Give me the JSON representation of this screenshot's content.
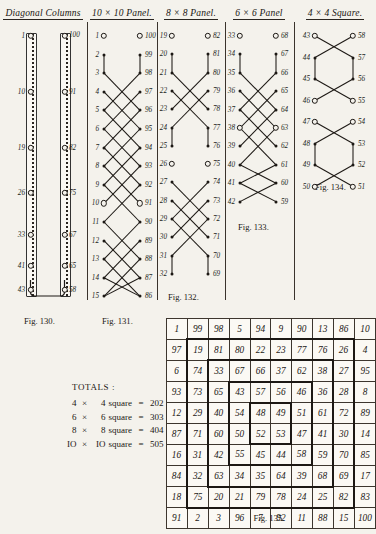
{
  "page": {
    "headings": [
      {
        "id": "diagonal-columns",
        "label": "Diagonal Columns"
      },
      {
        "id": "panel-10x10",
        "label": "10 × 10 Panel."
      },
      {
        "id": "panel-8x8",
        "label": "8 × 8 Panel."
      },
      {
        "id": "panel-6x6",
        "label": "6 × 6 Panel"
      },
      {
        "id": "square-4x4",
        "label": "4 × 4 Square."
      }
    ],
    "captions": {
      "fig130": "Fig. 130.",
      "fig131": "Fig. 131.",
      "fig132": "Fig. 132.",
      "fig133": "Fig. 133.",
      "fig134": "Fig. 134.",
      "fig135": "Fig. 135."
    }
  },
  "diagonal_columns": {
    "left_labels": [
      "1",
      "10",
      "19",
      "26",
      "33",
      "41",
      "43"
    ],
    "right_labels": [
      "100",
      "91",
      "82",
      "75",
      "67",
      "65",
      "58"
    ]
  },
  "panel_10x10": {
    "left_labels": [
      "1",
      "2",
      "3",
      "4",
      "5",
      "6",
      "7",
      "8",
      "9",
      "10",
      "11",
      "12",
      "13",
      "14",
      "15"
    ],
    "right_labels": [
      "100",
      "99",
      "98",
      "97",
      "96",
      "95",
      "94",
      "93",
      "92",
      "91",
      "90",
      "89",
      "88",
      "87",
      "86"
    ]
  },
  "panel_8x8": {
    "left_labels": [
      "19",
      "20",
      "21",
      "22",
      "23",
      "24",
      "25",
      "26",
      "27",
      "28",
      "29",
      "30",
      "31",
      "32"
    ],
    "right_labels": [
      "82",
      "81",
      "80",
      "79",
      "78",
      "77",
      "76",
      "75",
      "74",
      "73",
      "72",
      "71",
      "70",
      "69"
    ]
  },
  "panel_6x6": {
    "left_labels": [
      "33",
      "34",
      "35",
      "36",
      "37",
      "38",
      "39",
      "40",
      "41",
      "42"
    ],
    "right_labels": [
      "68",
      "67",
      "66",
      "65",
      "64",
      "63",
      "62",
      "61",
      "60",
      "59"
    ]
  },
  "square_4x4": {
    "left_labels": [
      "43",
      "44",
      "45",
      "46",
      "47",
      "48",
      "49",
      "50"
    ],
    "right_labels": [
      "58",
      "57",
      "56",
      "55",
      "54",
      "53",
      "52",
      "51"
    ]
  },
  "totals": {
    "title": "TOTALS :",
    "rows": [
      {
        "a": "4",
        "x": "×",
        "b": "4",
        "word": "square",
        "eq": "=",
        "value": "202"
      },
      {
        "a": "6",
        "x": "×",
        "b": "6",
        "word": "square",
        "eq": "=",
        "value": "303"
      },
      {
        "a": "8",
        "x": "×",
        "b": "8",
        "word": "square",
        "eq": "=",
        "value": "404"
      },
      {
        "a": "IO",
        "x": "×",
        "b": "IO",
        "word": "square",
        "eq": "=",
        "value": "505"
      }
    ]
  },
  "chart_data": {
    "type": "table",
    "title": "Fig. 135.",
    "rows": [
      [
        "1",
        "99",
        "98",
        "5",
        "94",
        "9",
        "90",
        "13",
        "86",
        "10"
      ],
      [
        "97",
        "19",
        "81",
        "80",
        "22",
        "23",
        "77",
        "76",
        "26",
        "4"
      ],
      [
        "6",
        "74",
        "33",
        "67",
        "66",
        "37",
        "62",
        "38",
        "27",
        "95"
      ],
      [
        "93",
        "73",
        "65",
        "43",
        "57",
        "56",
        "46",
        "36",
        "28",
        "8"
      ],
      [
        "12",
        "29",
        "40",
        "54",
        "48",
        "49",
        "51",
        "61",
        "72",
        "89"
      ],
      [
        "87",
        "71",
        "60",
        "50",
        "52",
        "53",
        "47",
        "41",
        "30",
        "14"
      ],
      [
        "16",
        "31",
        "42",
        "55",
        "45",
        "44",
        "58",
        "59",
        "70",
        "85"
      ],
      [
        "84",
        "32",
        "63",
        "34",
        "35",
        "64",
        "39",
        "68",
        "69",
        "17"
      ],
      [
        "18",
        "75",
        "20",
        "21",
        "79",
        "78",
        "24",
        "25",
        "82",
        "83"
      ],
      [
        "91",
        "2",
        "3",
        "96",
        "7",
        "92",
        "11",
        "88",
        "15",
        "100"
      ]
    ]
  }
}
